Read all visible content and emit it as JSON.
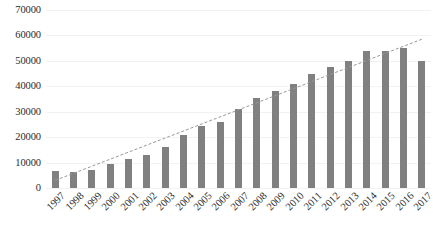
{
  "chart_data": {
    "type": "bar",
    "title": "",
    "subtitle": "",
    "xlabel": "",
    "ylabel": "",
    "categories": [
      "1997",
      "1998",
      "1999",
      "2000",
      "2001",
      "2002",
      "2003",
      "2004",
      "2005",
      "2006",
      "2007",
      "2008",
      "2009",
      "2010",
      "2011",
      "2012",
      "2013",
      "2014",
      "2015",
      "2016",
      "2017"
    ],
    "values": [
      6500,
      6300,
      7200,
      9500,
      11300,
      13000,
      16200,
      20800,
      24200,
      26000,
      31200,
      35500,
      38200,
      41000,
      45000,
      47500,
      49800,
      54000,
      53800,
      55000,
      50000
    ],
    "series": [
      {
        "name": "bars",
        "values": [
          6500,
          6300,
          7200,
          9500,
          11300,
          13000,
          16200,
          20800,
          24200,
          26000,
          31200,
          35500,
          38200,
          41000,
          45000,
          47500,
          49800,
          54000,
          53800,
          55000,
          50000
        ]
      },
      {
        "name": "trendline",
        "type": "line",
        "style": "dashed",
        "start_value": 3000,
        "end_value": 58500
      }
    ],
    "ylim": [
      0,
      70000
    ],
    "ytick_values": [
      0,
      10000,
      20000,
      30000,
      40000,
      50000,
      60000,
      70000
    ],
    "ytick_labels": [
      "0",
      "10000",
      "20000",
      "30000",
      "40000",
      "50000",
      "60000",
      "70000"
    ],
    "grid": true,
    "legend": false,
    "legend_position": "none",
    "bar_color": "#808080",
    "trendline_color": "#999999",
    "background_color": "#ffffff",
    "text_color": "#2b2b2b",
    "xtick_rotation": -45
  }
}
